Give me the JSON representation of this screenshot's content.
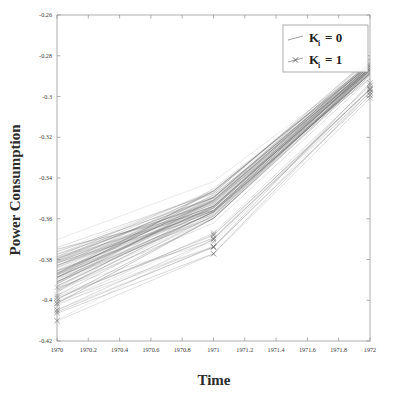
{
  "figure": {
    "background_color": "#ffffff",
    "frame_color": "#9a9a9a"
  },
  "axes": {
    "x_title": "Time",
    "y_title": "Power Consumption"
  },
  "legend": {
    "position": "top-right",
    "entries": [
      {
        "label_base": "K",
        "label_sub": "i",
        "label_rest": "= 0",
        "marker": "none",
        "line_style": "solid",
        "color": "#6e6e6e"
      },
      {
        "label_base": "K",
        "label_sub": "i",
        "label_rest": "= 1",
        "marker": "x",
        "line_style": "solid",
        "color": "#6e6e6e"
      }
    ]
  },
  "chart_data": {
    "type": "line",
    "title": "",
    "xlabel": "Time",
    "ylabel": "Power Consumption",
    "xlim": [
      1970,
      1972
    ],
    "ylim": [
      -0.42,
      -0.26
    ],
    "grid": false,
    "legend_position": "upper right",
    "x": [
      1970,
      1971,
      1972
    ],
    "xticks": [
      1970,
      1970.2,
      1970.4,
      1970.6,
      1970.8,
      1971,
      1971.2,
      1971.4,
      1971.6,
      1971.8,
      1972
    ],
    "xticklabels": [
      "1970",
      "1970.2",
      "1970.4",
      "1970.6",
      "1970.8",
      "1971",
      "1971.2",
      "1971.4",
      "1971.6",
      "1971.8",
      "1972"
    ],
    "yticks": [
      -0.26,
      -0.28,
      -0.3,
      -0.32,
      -0.34,
      -0.36,
      -0.38,
      -0.4,
      -0.42
    ],
    "yticklabels": [
      "-0.26",
      "-0.28",
      "-0.3",
      "-0.32",
      "-0.34",
      "-0.36",
      "-0.38",
      "-0.4",
      "-0.42"
    ],
    "series": [
      {
        "name": "K_i = 0",
        "marker": "none",
        "n_trajectories": 70,
        "start_mean": -0.386,
        "start_spread": 0.016,
        "mid_mean": -0.352,
        "mid_spread": 0.012,
        "end_mean": -0.286,
        "end_spread": 0.008,
        "values": [
          -0.386,
          -0.352,
          -0.286
        ]
      },
      {
        "name": "K_i = 1",
        "marker": "x",
        "n_trajectories": 14,
        "start_mean": -0.404,
        "start_spread": 0.012,
        "mid_mean": -0.372,
        "mid_spread": 0.01,
        "end_mean": -0.296,
        "end_spread": 0.009,
        "values": [
          -0.404,
          -0.372,
          -0.296
        ]
      }
    ]
  }
}
